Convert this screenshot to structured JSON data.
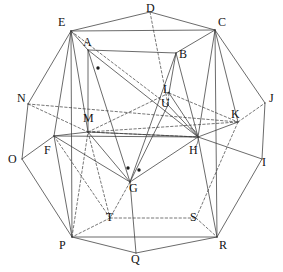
{
  "figure": {
    "type": "geometry-diagram",
    "title": "",
    "width": 283,
    "height": 272,
    "background_color": "#ffffff",
    "line_color": "#3a3a3a",
    "dashed_line_color": "#4a4a4a",
    "label_color": "#121212"
  },
  "vertices": [
    {
      "id": "A",
      "label": "A",
      "x": 88,
      "y": 50,
      "label_x": 83,
      "label_y": 36,
      "hidden": false
    },
    {
      "id": "B",
      "label": "B",
      "x": 176,
      "y": 53,
      "label_x": 179,
      "label_y": 48,
      "hidden": false
    },
    {
      "id": "C",
      "label": "C",
      "x": 215,
      "y": 30,
      "label_x": 218,
      "label_y": 16,
      "hidden": false
    },
    {
      "id": "D",
      "label": "D",
      "x": 150,
      "y": 12,
      "label_x": 146,
      "label_y": 2,
      "hidden": false
    },
    {
      "id": "E",
      "label": "E",
      "x": 71,
      "y": 31,
      "label_x": 58,
      "label_y": 16,
      "hidden": false
    },
    {
      "id": "F",
      "label": "F",
      "x": 54,
      "y": 136,
      "label_x": 44,
      "label_y": 144,
      "hidden": false
    },
    {
      "id": "G",
      "label": "G",
      "x": 130,
      "y": 182,
      "label_x": 129,
      "label_y": 182,
      "hidden": false
    },
    {
      "id": "H",
      "label": "H",
      "x": 198,
      "y": 137,
      "label_x": 189,
      "label_y": 144,
      "hidden": false
    },
    {
      "id": "I",
      "label": "I",
      "x": 262,
      "y": 159,
      "label_x": 262,
      "label_y": 156,
      "hidden": false
    },
    {
      "id": "J",
      "label": "J",
      "x": 265,
      "y": 103,
      "label_x": 269,
      "label_y": 92,
      "hidden": false
    },
    {
      "id": "K",
      "label": "K",
      "x": 238,
      "y": 122,
      "label_x": 231,
      "label_y": 108,
      "hidden": false
    },
    {
      "id": "L",
      "label": "L",
      "x": 169,
      "y": 93,
      "label_x": 163,
      "label_y": 83,
      "hidden": false
    },
    {
      "id": "M",
      "label": "M",
      "x": 88,
      "y": 132,
      "label_x": 83,
      "label_y": 112,
      "hidden": false
    },
    {
      "id": "N",
      "label": "N",
      "x": 28,
      "y": 104,
      "label_x": 17,
      "label_y": 92,
      "hidden": true
    },
    {
      "id": "O",
      "label": "O",
      "x": 22,
      "y": 159,
      "label_x": 8,
      "label_y": 153,
      "hidden": false
    },
    {
      "id": "P",
      "label": "P",
      "x": 72,
      "y": 237,
      "label_x": 59,
      "label_y": 239,
      "hidden": false
    },
    {
      "id": "Q",
      "label": "Q",
      "x": 136,
      "y": 253,
      "label_x": 131,
      "label_y": 253,
      "hidden": false
    },
    {
      "id": "R",
      "label": "R",
      "x": 217,
      "y": 237,
      "label_x": 219,
      "label_y": 239,
      "hidden": false
    },
    {
      "id": "S",
      "label": "S",
      "x": 196,
      "y": 218,
      "label_x": 190,
      "label_y": 211,
      "hidden": true
    },
    {
      "id": "T",
      "label": "T",
      "x": 110,
      "y": 218,
      "label_x": 106,
      "label_y": 211,
      "hidden": true
    },
    {
      "id": "U",
      "label": "U",
      "x": 168,
      "y": 105,
      "label_x": 161,
      "label_y": 97,
      "hidden": false
    }
  ],
  "edges_solid": [
    [
      "E",
      "D"
    ],
    [
      "D",
      "C"
    ],
    [
      "E",
      "C"
    ],
    [
      "A",
      "B"
    ],
    [
      "E",
      "A"
    ],
    [
      "A",
      "M"
    ],
    [
      "A",
      "G"
    ],
    [
      "A",
      "H"
    ],
    [
      "B",
      "C"
    ],
    [
      "B",
      "L"
    ],
    [
      "B",
      "G"
    ],
    [
      "B",
      "H"
    ],
    [
      "E",
      "N"
    ],
    [
      "E",
      "F"
    ],
    [
      "E",
      "M"
    ],
    [
      "E",
      "P"
    ],
    [
      "C",
      "J"
    ],
    [
      "C",
      "K"
    ],
    [
      "C",
      "H"
    ],
    [
      "C",
      "R"
    ],
    [
      "N",
      "O"
    ],
    [
      "O",
      "F"
    ],
    [
      "O",
      "P"
    ],
    [
      "F",
      "M"
    ],
    [
      "F",
      "H"
    ],
    [
      "F",
      "G"
    ],
    [
      "F",
      "P"
    ],
    [
      "M",
      "H"
    ],
    [
      "M",
      "G"
    ],
    [
      "G",
      "H"
    ],
    [
      "G",
      "Q"
    ],
    [
      "H",
      "I"
    ],
    [
      "H",
      "R"
    ],
    [
      "J",
      "I"
    ],
    [
      "I",
      "R"
    ],
    [
      "K",
      "H"
    ],
    [
      "P",
      "R"
    ],
    [
      "P",
      "Q"
    ],
    [
      "Q",
      "R"
    ],
    [
      "U",
      "G"
    ],
    [
      "U",
      "H"
    ],
    [
      "L",
      "H"
    ]
  ],
  "edges_dashed": [
    [
      "E",
      "U"
    ],
    [
      "D",
      "U"
    ],
    [
      "U",
      "L"
    ],
    [
      "N",
      "M"
    ],
    [
      "N",
      "K"
    ],
    [
      "M",
      "K"
    ],
    [
      "M",
      "L"
    ],
    [
      "K",
      "J"
    ],
    [
      "K",
      "S"
    ],
    [
      "M",
      "T"
    ],
    [
      "T",
      "S"
    ],
    [
      "T",
      "P"
    ],
    [
      "S",
      "R"
    ],
    [
      "F",
      "T"
    ],
    [
      "P",
      "M"
    ],
    [
      "G",
      "T"
    ],
    [
      "L",
      "K"
    ],
    [
      "M",
      "H"
    ]
  ],
  "angle_marks": [
    {
      "at": "H",
      "radius": 12,
      "start_deg": 130,
      "end_deg": 250
    }
  ],
  "point_marks": [
    {
      "name": "dot-near-A",
      "x": 98,
      "y": 68
    },
    {
      "name": "dot-left-of-G",
      "x": 128,
      "y": 168
    },
    {
      "name": "dot-right-of-G",
      "x": 139,
      "y": 170
    }
  ]
}
